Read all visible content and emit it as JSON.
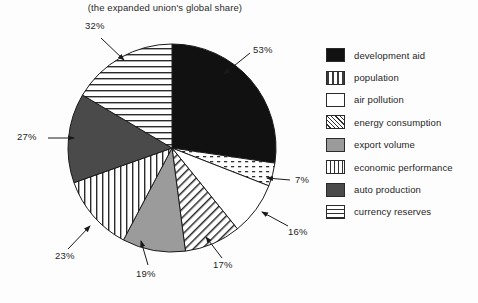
{
  "chart_data": {
    "type": "pie",
    "title": "(the expanded union's global share)",
    "xlabel": "",
    "ylabel": "",
    "legend_position": "right",
    "grid": false,
    "note": "Slice angles are proportional to the listed percentage values (values sum to 194%, each is an independent global share).",
    "categories": [
      "development aid",
      "population",
      "air pollution",
      "energy consumption",
      "export volume",
      "economic performance",
      "auto production",
      "currency reserves"
    ],
    "values": [
      53,
      7,
      16,
      17,
      19,
      23,
      27,
      32
    ],
    "labels": [
      "53%",
      "7%",
      "16%",
      "17%",
      "19%",
      "23%",
      "27%",
      "32%"
    ],
    "patterns": [
      "solid-black",
      "dotted",
      "white",
      "diagonal-hatch",
      "solid-gray",
      "vertical-lines",
      "dark-gray",
      "horizontal-lines"
    ]
  },
  "legend": {
    "items": [
      {
        "label": "development aid",
        "swatch": "solid-black"
      },
      {
        "label": "population",
        "swatch": "dotted"
      },
      {
        "label": "air pollution",
        "swatch": "white"
      },
      {
        "label": "energy consumption",
        "swatch": "diagonal-hatch"
      },
      {
        "label": "export volume",
        "swatch": "solid-gray"
      },
      {
        "label": "economic performance",
        "swatch": "vertical-lines"
      },
      {
        "label": "auto production",
        "swatch": "dark-gray"
      },
      {
        "label": "currency reserves",
        "swatch": "horizontal-lines"
      }
    ]
  },
  "callouts": [
    {
      "text": "32%",
      "slice": "currency reserves"
    },
    {
      "text": "53%",
      "slice": "development aid"
    },
    {
      "text": "7%",
      "slice": "population"
    },
    {
      "text": "16%",
      "slice": "air pollution"
    },
    {
      "text": "17%",
      "slice": "energy consumption"
    },
    {
      "text": "19%",
      "slice": "export volume"
    },
    {
      "text": "23%",
      "slice": "economic performance"
    },
    {
      "text": "27%",
      "slice": "auto production"
    }
  ],
  "colors": {
    "ink": "#1a1a1a",
    "black_slice": "#111111",
    "gray_slice": "#9b9b9b",
    "dark_gray_slice": "#4a4a4a",
    "background": "#fdfdfd"
  }
}
